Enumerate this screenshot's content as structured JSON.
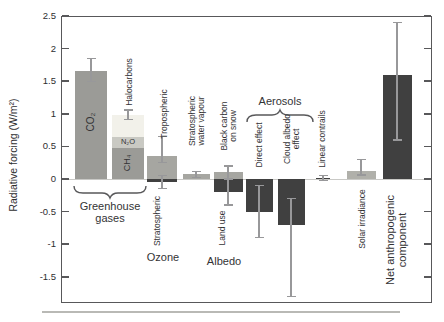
{
  "chart_data": {
    "type": "bar",
    "title": "",
    "ylabel": "Radiative forcing (W/m²)",
    "ylim": [
      -1.9,
      2.5
    ],
    "yticks": [
      "2.5",
      "2",
      "1.5",
      "1",
      "0.5",
      "0",
      "-0.5",
      "-1",
      "-1.5"
    ],
    "ytick_values": [
      2.5,
      2.0,
      1.5,
      1.0,
      0.5,
      0.0,
      -0.5,
      -1.0,
      -1.5
    ],
    "grid": "off",
    "legend": "none",
    "bars": [
      {
        "id": "co2",
        "label": "CO2",
        "cx": 91,
        "w": 32,
        "v0": 0,
        "v1": 1.66,
        "color": "gray1",
        "err": [
          1.5,
          1.85
        ]
      },
      {
        "id": "ch4",
        "label": "CH4",
        "cx": 128,
        "w": 32,
        "v0": 0,
        "v1": 0.48,
        "color": "gray1"
      },
      {
        "id": "n2o",
        "label": "N2O",
        "cx": 128,
        "w": 32,
        "v0": 0.48,
        "v1": 0.64,
        "color": "gray2"
      },
      {
        "id": "halocarbons",
        "label": "Halocarbons",
        "cx": 128,
        "w": 32,
        "v0": 0.64,
        "v1": 0.98,
        "color": "gray3",
        "err": [
          0.91,
          1.06
        ]
      },
      {
        "id": "tropospheric-ozone",
        "label": "Tropospheric ozone",
        "cx": 162,
        "w": 30,
        "v0": 0,
        "v1": 0.35,
        "color": "gray4",
        "err": [
          0.25,
          0.65
        ]
      },
      {
        "id": "stratospheric-ozone",
        "label": "Stratospheric ozone",
        "cx": 162,
        "w": 30,
        "v0": 0,
        "v1": -0.05,
        "color": "dark",
        "err": [
          -0.15,
          0.05
        ]
      },
      {
        "id": "stratospheric-water-vapour",
        "label": "Stratospheric water vapour",
        "cx": 196,
        "w": 27,
        "v0": 0,
        "v1": 0.07,
        "color": "gray4",
        "err": [
          0.02,
          0.12
        ]
      },
      {
        "id": "black-carbon-on-snow",
        "label": "Black carbon on snow",
        "cx": 228,
        "w": 29,
        "v0": 0,
        "v1": 0.1,
        "color": "gray4",
        "err": [
          0.0,
          0.2
        ]
      },
      {
        "id": "land-use",
        "label": "Land use",
        "cx": 228,
        "w": 29,
        "v0": 0,
        "v1": -0.2,
        "color": "dark",
        "err": [
          -0.4,
          0.0
        ]
      },
      {
        "id": "aerosol-direct-effect",
        "label": "Direct effect",
        "cx": 259,
        "w": 27,
        "v0": 0,
        "v1": -0.5,
        "color": "dark",
        "err": [
          -0.9,
          -0.1
        ]
      },
      {
        "id": "cloud-albedo-effect",
        "label": "Cloud albedo effect",
        "cx": 291,
        "w": 27,
        "v0": 0,
        "v1": -0.7,
        "color": "dark",
        "err": [
          -1.8,
          -0.3
        ]
      },
      {
        "id": "linear-contrails",
        "label": "Linear contrails",
        "cx": 323,
        "w": 14,
        "v0": 0,
        "v1": 0.02,
        "color": "dark",
        "err": [
          -0.02,
          0.05
        ]
      },
      {
        "id": "solar-irradiance",
        "label": "Solar irradiance",
        "cx": 361,
        "w": 29,
        "v0": 0,
        "v1": 0.12,
        "color": "gray5",
        "err": [
          0.06,
          0.3
        ]
      },
      {
        "id": "net-anthropogenic",
        "label": "Net anthropogenic component",
        "cx": 397,
        "w": 29,
        "v0": 0,
        "v1": 1.6,
        "color": "dark",
        "err": [
          0.6,
          2.4
        ]
      }
    ],
    "in_bar_labels": [
      {
        "id": "co2-label",
        "text": "CO₂",
        "x": 91,
        "y": 122,
        "rot": true,
        "size": 10
      },
      {
        "id": "ch4-label",
        "text": "CH₄",
        "x": 128,
        "y": 163,
        "rot": true,
        "size": 9
      },
      {
        "id": "n2o-label",
        "text": "N₂O",
        "x": 128,
        "y": 142,
        "rot": false,
        "size": 7.5
      }
    ],
    "rotated_labels": [
      {
        "id": "halocarbons-label",
        "lines": [
          "Halocarbons"
        ],
        "x": 129,
        "y": 82,
        "size": 8.5
      },
      {
        "id": "tropospheric-label",
        "lines": [
          "Tropospheric"
        ],
        "x": 164,
        "y": 114,
        "size": 8.5
      },
      {
        "id": "stratospheric-water-vapour-label",
        "lines": [
          "Stratospheric",
          "water vapour"
        ],
        "x": 197,
        "y": 121,
        "size": 8.5
      },
      {
        "id": "black-carbon-on-snow-label",
        "lines": [
          "Black carbon",
          "on snow"
        ],
        "x": 229,
        "y": 126,
        "size": 8.5
      },
      {
        "id": "direct-effect-label",
        "lines": [
          "Direct effect"
        ],
        "x": 259,
        "y": 145,
        "size": 8.5
      },
      {
        "id": "cloud-albedo-effect-label",
        "lines": [
          "Cloud albedo",
          "effect"
        ],
        "x": 292,
        "y": 139,
        "size": 8.5
      },
      {
        "id": "linear-contrails-label",
        "lines": [
          "Linear contrails"
        ],
        "x": 322,
        "y": 139,
        "size": 8.5
      },
      {
        "id": "stratospheric-label",
        "lines": [
          "Stratospheric"
        ],
        "x": 157,
        "y": 221,
        "size": 8.5
      },
      {
        "id": "land-use-label",
        "lines": [
          "Land use"
        ],
        "x": 222,
        "y": 228,
        "size": 8.5
      },
      {
        "id": "solar-irradiance-label",
        "lines": [
          "Solar irradiance"
        ],
        "x": 362,
        "y": 219,
        "size": 8.5
      },
      {
        "id": "net-anthropogenic-label",
        "lines": [
          "Net anthropogenic",
          "component"
        ],
        "x": 397,
        "y": 240,
        "size": 11
      }
    ],
    "group_labels": [
      {
        "id": "greenhouse-gases-label",
        "lines": [
          "Greenhouse",
          "gases"
        ],
        "x": 110,
        "y": 212,
        "size": 11
      },
      {
        "id": "ozone-label",
        "lines": [
          "Ozone"
        ],
        "x": 163,
        "y": 257,
        "size": 11
      },
      {
        "id": "albedo-label",
        "lines": [
          "Albedo"
        ],
        "x": 224,
        "y": 261,
        "size": 11
      },
      {
        "id": "aerosols-label",
        "lines": [
          "Aerosols"
        ],
        "x": 280,
        "y": 101,
        "size": 11
      }
    ],
    "braces": [
      {
        "id": "greenhouse-gases-brace",
        "x1": 74,
        "x2": 146,
        "y_end": 186,
        "y_body": 193,
        "y_point": 198
      },
      {
        "id": "aerosols-brace",
        "x1": 247,
        "x2": 313,
        "y_end": 122,
        "y_body": 115,
        "y_point": 110
      }
    ],
    "colors": {
      "gray1": "#9b9b97",
      "gray2": "#c9c9c3",
      "gray3": "#f2f1ea",
      "gray4": "#a6a6a1",
      "gray5": "#b0b0aa",
      "dark": "#404040",
      "error": "#98989a",
      "axis": "#58585a",
      "text": "#333335"
    },
    "layout": {
      "plot": {
        "left": 61,
        "top": 16,
        "right": 432,
        "bottom": 303
      },
      "zero_y": 179,
      "px_per_unit": 65.2,
      "tick_len": 7,
      "bottom_rule": {
        "x1": 42,
        "x2": 400,
        "y": 311
      }
    }
  }
}
